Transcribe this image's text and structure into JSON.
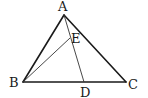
{
  "diagram": {
    "type": "geometry",
    "colors": {
      "stroke": "#1a1a1a",
      "background": "#ffffff"
    },
    "points": {
      "A": {
        "label": "A",
        "x": 64,
        "y": 15
      },
      "B": {
        "label": "B",
        "x": 23,
        "y": 82
      },
      "C": {
        "label": "C",
        "x": 126,
        "y": 82
      },
      "D": {
        "label": "D",
        "x": 84,
        "y": 82
      },
      "E": {
        "label": "E",
        "x": 70,
        "y": 38
      }
    },
    "segments": [
      {
        "from": "A",
        "to": "B",
        "weight": "thick"
      },
      {
        "from": "A",
        "to": "C",
        "weight": "thick"
      },
      {
        "from": "B",
        "to": "C",
        "weight": "thick"
      },
      {
        "from": "A",
        "to": "D",
        "weight": "thin"
      },
      {
        "from": "B",
        "to": "E",
        "weight": "thin"
      }
    ]
  }
}
